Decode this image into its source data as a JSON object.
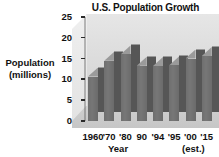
{
  "chart_data": {
    "type": "bar",
    "title": "U.S. Population Growth of 15- to19-year-olds",
    "title_lines": [
      "U.S. Population Growth",
      "of 15- to19-year-olds"
    ],
    "xlabel": "Year",
    "ylabel": "Population (millions)",
    "ylabel_lines": [
      "Population",
      "(millions)"
    ],
    "categories": [
      "1960",
      "'70",
      "'80",
      "90",
      "'94",
      "'95",
      "'00",
      "'15"
    ],
    "values": [
      10.7,
      14.5,
      16.0,
      13.3,
      13.2,
      13.4,
      15.0,
      15.6
    ],
    "ylim": [
      0,
      25
    ],
    "yticks": [
      "0",
      "5",
      "10",
      "15",
      "20",
      "25"
    ],
    "ytick_values": [
      0,
      5,
      10,
      15,
      20,
      25
    ],
    "grid": false,
    "legend": "none",
    "annotation": "(est.)",
    "annotation_applies_to": "'15",
    "style": "3d-bars",
    "colors": {
      "bar_front": "#6f6f6f",
      "bar_side": "#565656",
      "bar_top": "#8d8d8d",
      "back_wall": "#dcdcdc",
      "floor": "#c9c9c9",
      "text": "#111111",
      "background": "#ffffff"
    }
  }
}
